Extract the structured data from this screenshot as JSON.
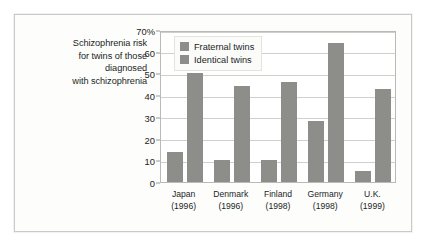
{
  "caption": {
    "lines": [
      "Schizophrenia risk",
      "for twins of those",
      "diagnosed",
      "with schizophrenia"
    ]
  },
  "legend": {
    "items": [
      {
        "label": "Fraternal twins",
        "color": "#8d8d8a"
      },
      {
        "label": "Identical twins",
        "color": "#8d8d8a"
      }
    ]
  },
  "colors": {
    "bar": "#8d8d8a",
    "gridline": "#cfcfcc",
    "plot_border": "#b9b9b6",
    "card_border": "#c9c9c6",
    "text": "#211f1e"
  },
  "chart_data": {
    "type": "bar",
    "title": "",
    "subtitle": "",
    "xlabel": "",
    "ylabel": "",
    "ylim": [
      0,
      70
    ],
    "yticks": [
      0,
      10,
      20,
      30,
      40,
      50,
      60,
      70
    ],
    "ytick_labels": [
      "0",
      "10",
      "20",
      "30",
      "40",
      "50",
      "60",
      "70%"
    ],
    "grid": true,
    "legend_position": "top-left-inside",
    "categories": [
      "Japan",
      "Denmark",
      "Finland",
      "Germany",
      "U.K."
    ],
    "category_years": [
      "(1996)",
      "(1996)",
      "(1998)",
      "(1998)",
      "(1999)"
    ],
    "series": [
      {
        "name": "Fraternal twins",
        "values": [
          14,
          10,
          10,
          28,
          5
        ]
      },
      {
        "name": "Identical twins",
        "values": [
          50,
          44,
          46,
          64,
          43
        ]
      }
    ]
  }
}
